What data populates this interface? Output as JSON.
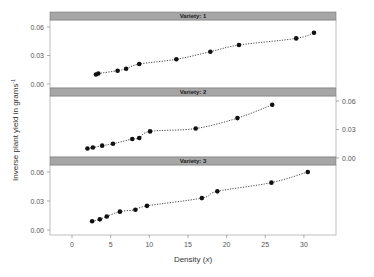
{
  "chart_data": {
    "type": "scatter",
    "layout": "faceted-3-panels-vertical",
    "xlabel": "Density (x)",
    "xlabel_main": "Density ",
    "xlabel_var": "x",
    "ylabel": "Inverse plant yield in grams^-1",
    "ylabel_main": "Inverse plant yield in grams",
    "ylabel_sup": "-1",
    "xlim": [
      -3,
      34
    ],
    "ylim": [
      0,
      0.065
    ],
    "x_ticks": [
      0,
      5,
      10,
      15,
      20,
      25,
      30
    ],
    "y_ticks": [
      0.0,
      0.03,
      0.06
    ],
    "y_tick_labels": [
      "0.00",
      "0.03",
      "0.06"
    ],
    "grid": false,
    "line_style": "dotted smooth fit",
    "panels": [
      {
        "strip": "Variety: 1",
        "axis_side": "left",
        "x": [
          3.1,
          3.4,
          5.9,
          7.0,
          8.7,
          13.5,
          17.9,
          21.6,
          29.0,
          31.3
        ],
        "y": [
          0.01,
          0.011,
          0.014,
          0.016,
          0.021,
          0.026,
          0.034,
          0.041,
          0.048,
          0.054
        ]
      },
      {
        "strip": "Variety: 2",
        "axis_side": "right",
        "x": [
          2.0,
          2.7,
          3.9,
          5.3,
          7.8,
          8.7,
          10.1,
          16.0,
          21.4,
          25.9
        ],
        "y": [
          0.01,
          0.011,
          0.013,
          0.015,
          0.02,
          0.021,
          0.028,
          0.031,
          0.042,
          0.056
        ]
      },
      {
        "strip": "Variety: 3",
        "axis_side": "left",
        "x": [
          2.6,
          3.6,
          4.5,
          6.2,
          8.2,
          9.7,
          16.8,
          18.8,
          25.8,
          30.5
        ],
        "y": [
          0.009,
          0.011,
          0.014,
          0.019,
          0.021,
          0.025,
          0.033,
          0.04,
          0.049,
          0.06
        ]
      }
    ]
  },
  "colors": {
    "strip_fill": "#a6a6a6",
    "strip_border": "#7a7a7a",
    "panel_border": "#b0b0b0",
    "point": "#111111",
    "fit_line": "#333333",
    "text": "#555555"
  }
}
